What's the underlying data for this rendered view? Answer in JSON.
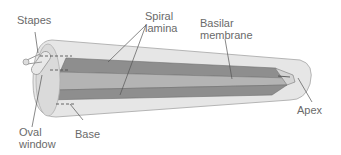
{
  "diagram": {
    "labels": {
      "stapes": "Stapes",
      "spiral_lamina_1": "Spiral",
      "spiral_lamina_2": "lamina",
      "basilar_membrane_1": "Basilar",
      "basilar_membrane_2": "membrane",
      "apex": "Apex",
      "oval_window_1": "Oval",
      "oval_window_2": "window",
      "base": "Base"
    },
    "colors": {
      "outer_tube": "#e6e6e6",
      "outer_stroke": "#b5b5b5",
      "lamina_dark": "#8e8e8e",
      "membrane_mid": "#a8a8a8",
      "lines": "#555555",
      "text": "#6a6a6a"
    }
  }
}
